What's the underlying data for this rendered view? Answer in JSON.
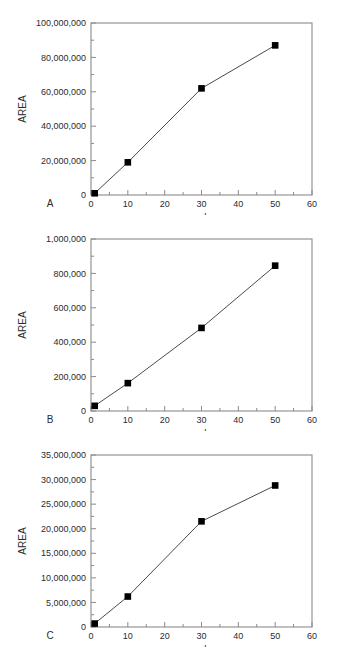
{
  "figure": {
    "background_color": "#ffffff",
    "axis_color": "#8a8a8a",
    "line_color": "#4a4a4a",
    "marker_color": "#000000",
    "text_color": "#2b2b2b",
    "panel_labels": [
      "A",
      "B",
      "C"
    ],
    "caption_fragment": ""
  },
  "chart_data": [
    {
      "type": "line",
      "panel_label": "A",
      "title": "",
      "xlabel": "ppb",
      "ylabel": "AREA",
      "x": [
        1,
        10,
        30,
        50
      ],
      "values": [
        1000000,
        19000000,
        62000000,
        87000000
      ],
      "xlim": [
        0,
        60
      ],
      "ylim": [
        0,
        100000000
      ],
      "xticks": [
        0,
        10,
        20,
        30,
        40,
        50,
        60
      ],
      "xtick_labels": [
        "0",
        "10",
        "20",
        "30",
        "40",
        "50",
        "60"
      ],
      "yticks": [
        0,
        20000000,
        40000000,
        60000000,
        80000000,
        100000000
      ],
      "ytick_labels": [
        "0",
        "20,000,000",
        "40,000,000",
        "60,000,000",
        "80,000,000",
        "100,000,000"
      ],
      "x_minor_step": 5,
      "y_minor_step": 10000000,
      "grid": false,
      "legend": false,
      "marker": "square"
    },
    {
      "type": "line",
      "panel_label": "B",
      "title": "",
      "xlabel": "ppb",
      "ylabel": "AREA",
      "x": [
        1,
        10,
        30,
        50
      ],
      "values": [
        30000,
        162000,
        483000,
        845000
      ],
      "xlim": [
        0,
        60
      ],
      "ylim": [
        0,
        1000000
      ],
      "xticks": [
        0,
        10,
        20,
        30,
        40,
        50,
        60
      ],
      "xtick_labels": [
        "0",
        "10",
        "20",
        "30",
        "40",
        "50",
        "60"
      ],
      "yticks": [
        0,
        200000,
        400000,
        600000,
        800000,
        1000000
      ],
      "ytick_labels": [
        "0",
        "200,000",
        "400,000",
        "600,000",
        "800,000",
        "1,000,000"
      ],
      "x_minor_step": 5,
      "y_minor_step": 100000,
      "grid": false,
      "legend": false,
      "marker": "square"
    },
    {
      "type": "line",
      "panel_label": "C",
      "title": "",
      "xlabel": "ppb",
      "ylabel": "AREA",
      "x": [
        1,
        10,
        30,
        50
      ],
      "values": [
        700000,
        6200000,
        21500000,
        28800000
      ],
      "xlim": [
        0,
        60
      ],
      "ylim": [
        0,
        35000000
      ],
      "xticks": [
        0,
        10,
        20,
        30,
        40,
        50,
        60
      ],
      "xtick_labels": [
        "0",
        "10",
        "20",
        "30",
        "40",
        "50",
        "60"
      ],
      "yticks": [
        0,
        5000000,
        10000000,
        15000000,
        20000000,
        25000000,
        30000000,
        35000000
      ],
      "ytick_labels": [
        "0",
        "5,000,000",
        "10,000,000",
        "15,000,000",
        "20,000,000",
        "25,000,000",
        "30,000,000",
        "35,000,000"
      ],
      "x_minor_step": 5,
      "y_minor_step": 2500000,
      "grid": false,
      "legend": false,
      "marker": "square"
    }
  ]
}
